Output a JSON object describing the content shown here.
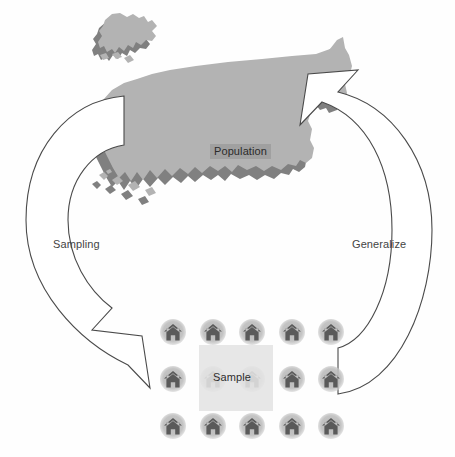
{
  "diagram": {
    "type": "cycle-diagram",
    "background_color": "#fefefe"
  },
  "population": {
    "label": "Population",
    "icon": "us-map-icon",
    "map_fill_color": "#b3b3b3",
    "map_shadow_color": "#808080",
    "label_background_color": "#a0a0a0",
    "label_text_color": "#2b2b2b",
    "regions": [
      "contiguous-united-states",
      "alaska",
      "hawaii"
    ]
  },
  "sample": {
    "label": "Sample",
    "box_color": "#e4e4e4",
    "house_icon": "house-icon",
    "house_color": "#5a5a5a",
    "circle_color": "#bebebe",
    "grid": {
      "rows": 3,
      "columns": 5,
      "total_houses": 15
    },
    "houses": [
      {
        "id": "house-r1c1",
        "row": 1,
        "col": 1
      },
      {
        "id": "house-r1c2",
        "row": 1,
        "col": 2
      },
      {
        "id": "house-r1c3",
        "row": 1,
        "col": 3
      },
      {
        "id": "house-r1c4",
        "row": 1,
        "col": 4
      },
      {
        "id": "house-r1c5",
        "row": 1,
        "col": 5
      },
      {
        "id": "house-r2c1",
        "row": 2,
        "col": 1
      },
      {
        "id": "house-r2c2",
        "row": 2,
        "col": 2
      },
      {
        "id": "house-r2c3",
        "row": 2,
        "col": 3
      },
      {
        "id": "house-r2c4",
        "row": 2,
        "col": 4
      },
      {
        "id": "house-r2c5",
        "row": 2,
        "col": 5
      },
      {
        "id": "house-r3c1",
        "row": 3,
        "col": 1
      },
      {
        "id": "house-r3c2",
        "row": 3,
        "col": 2
      },
      {
        "id": "house-r3c3",
        "row": 3,
        "col": 3
      },
      {
        "id": "house-r3c4",
        "row": 3,
        "col": 4
      },
      {
        "id": "house-r3c5",
        "row": 3,
        "col": 5
      }
    ]
  },
  "arrows": {
    "left": {
      "label": "Sampling",
      "direction": "population-to-sample",
      "style": "outlined-curved-arrow",
      "stroke_color": "#4a4a4a",
      "fill_color": "#ffffff"
    },
    "right": {
      "label": "Generalize",
      "direction": "sample-to-population",
      "style": "outlined-curved-arrow",
      "stroke_color": "#4a4a4a",
      "fill_color": "#ffffff"
    }
  }
}
